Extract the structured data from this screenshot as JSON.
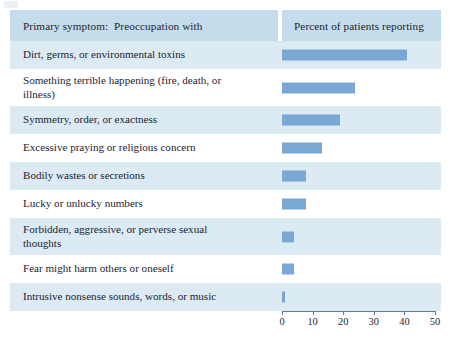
{
  "figure": {
    "header": {
      "left_label": "Primary symptom:  Preoccupation with",
      "right_label": "Percent of patients reporting"
    },
    "colors": {
      "bar": "#7ba7d4",
      "header_band": "#c5dcec",
      "row_band": "#dceaf4",
      "axis": "#5d7b98",
      "text": "#1b2430"
    }
  },
  "chart_data": {
    "type": "bar",
    "orientation": "horizontal",
    "title": "",
    "xlabel": "Percent of patients reporting",
    "ylabel": "Primary symptom:  Preoccupation with",
    "xlim": [
      0,
      50
    ],
    "xticks": [
      0,
      10,
      20,
      30,
      40,
      50
    ],
    "xtick_labels": [
      "0",
      "10",
      "20",
      "30",
      "40",
      "50"
    ],
    "grid": false,
    "legend": false,
    "categories": [
      "Dirt, germs, or environmental toxins",
      "Something terrible happening (fire, death, or\nillness)",
      "Symmetry, order, or exactness",
      "Excessive praying or religious concern",
      "Bodily wastes or secretions",
      "Lucky or unlucky numbers",
      "Forbidden, aggressive, or perverse sexual\nthoughts",
      "Fear might harm others or oneself",
      "Intrusive nonsense sounds, words, or music"
    ],
    "values": [
      41,
      24,
      19,
      13,
      8,
      8,
      4,
      4,
      1
    ]
  }
}
